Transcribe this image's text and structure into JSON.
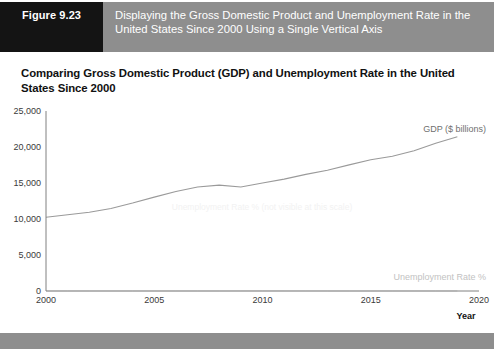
{
  "figure": {
    "number_label": "Figure 9.23",
    "caption": "Displaying the Gross Domestic Product and Unemployment Rate in the United States Since 2000 Using a Single Vertical Axis"
  },
  "chart_title": "Comparing Gross Domestic Product (GDP) and Unemployment Rate in the United States Since 2000",
  "labels": {
    "gdp_series": "GDP ($ billions)",
    "unemployment_series": "Unemployment Rate %",
    "x_axis_name": "Year",
    "watermark": "Unemployment Rate % (not visible at this scale)"
  },
  "colors": {
    "header_band": "#8e8e8e",
    "figure_block": "#141414",
    "gdp_line": "#9a9a9a",
    "unemployment_line": "#d8d8d8",
    "axis": "#808080"
  },
  "chart_data": {
    "type": "line",
    "title": "Comparing Gross Domestic Product (GDP) and Unemployment Rate in the United States Since 2000",
    "xlabel": "Year",
    "ylabel": "",
    "xlim": [
      2000,
      2020
    ],
    "ylim": [
      0,
      25000
    ],
    "grid": false,
    "legend": "inline-labels",
    "x_ticks": [
      "2000",
      "2005",
      "2010",
      "2015",
      "2020"
    ],
    "y_ticks": [
      "0",
      "5,000",
      "10,000",
      "15,000",
      "20,000",
      "25,000"
    ],
    "x": [
      2000,
      2001,
      2002,
      2003,
      2004,
      2005,
      2006,
      2007,
      2008,
      2009,
      2010,
      2011,
      2012,
      2013,
      2014,
      2015,
      2016,
      2017,
      2018,
      2019
    ],
    "series": [
      {
        "name": "GDP ($ billions)",
        "values": [
          10250,
          10580,
          10940,
          11460,
          12210,
          13040,
          13820,
          14450,
          14710,
          14450,
          14990,
          15540,
          16200,
          16780,
          17520,
          18220,
          18710,
          19490,
          20530,
          21430
        ]
      },
      {
        "name": "Unemployment Rate %",
        "values": [
          4.0,
          4.7,
          5.8,
          6.0,
          5.5,
          5.1,
          4.6,
          4.6,
          5.8,
          9.3,
          9.6,
          8.9,
          8.1,
          7.4,
          6.2,
          5.3,
          4.9,
          4.4,
          3.9,
          3.7
        ]
      }
    ]
  }
}
